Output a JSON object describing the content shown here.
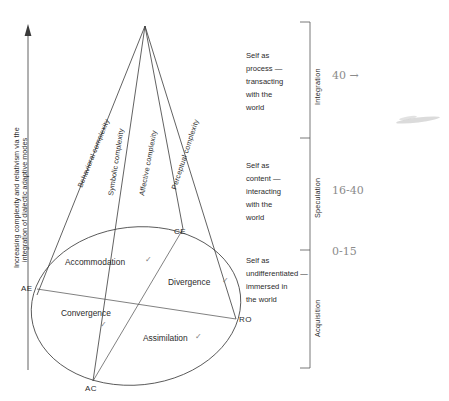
{
  "diagram": {
    "vertical_axis_label": "Increasing complexity and relativism via the integration of dialectic adaptive modes",
    "cone_labels": [
      "Behavioral complexity",
      "Symbolic complexity",
      "Affective complexity",
      "Perceptual complexity"
    ],
    "quadrants": [
      {
        "label": "Accommodation",
        "mark": "✓"
      },
      {
        "label": "Divergence",
        "mark": "✓"
      },
      {
        "label": "Convergence",
        "mark": "✓"
      },
      {
        "label": "Assimilation",
        "mark": "✓"
      }
    ],
    "poles": [
      {
        "code": "CE"
      },
      {
        "code": "AE"
      },
      {
        "code": "RO"
      },
      {
        "code": "AC"
      }
    ],
    "stages": [
      {
        "description": "Self as process — transacting with the world",
        "bracket_label": "Integration",
        "annotation": "40 →"
      },
      {
        "description": "Self as content — interacting with the world",
        "bracket_label": "Speculation",
        "annotation": "16-40"
      },
      {
        "description": "Self as undifferentiated — immersed in the world",
        "bracket_label": "Acquisition",
        "annotation": "0-15"
      }
    ]
  },
  "colors": {
    "ink": "#2b2b2b",
    "line": "#3a3a3a",
    "pencil": "#8b8b8b",
    "background": "#ffffff"
  }
}
